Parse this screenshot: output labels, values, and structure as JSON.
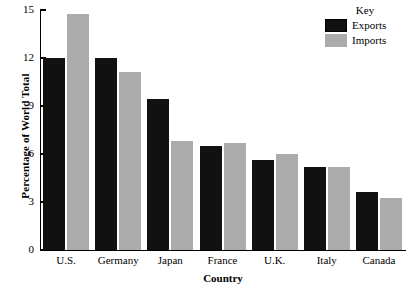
{
  "chart_data": {
    "type": "bar",
    "title": "",
    "xlabel": "Country",
    "ylabel": "Percentage of World Total",
    "categories": [
      "U.S.",
      "Germany",
      "Japan",
      "France",
      "U.K.",
      "Italy",
      "Canada"
    ],
    "series": [
      {
        "name": "Exports",
        "color": "#111111",
        "values": [
          12.0,
          12.0,
          9.45,
          6.5,
          5.6,
          5.2,
          3.6
        ]
      },
      {
        "name": "Imports",
        "color": "#ababab",
        "values": [
          14.75,
          11.1,
          6.8,
          6.7,
          6.0,
          5.2,
          3.25
        ]
      }
    ],
    "ylim": [
      0,
      15
    ],
    "yticks": [
      0,
      3,
      6,
      9,
      12,
      15
    ],
    "ytick_labels": [
      "0",
      "3",
      "6",
      "9",
      "12",
      "15"
    ],
    "grid": false,
    "legend": {
      "title": "Key",
      "position": "top-right",
      "entries": [
        {
          "label": "Exports",
          "color": "#111111"
        },
        {
          "label": "Imports",
          "color": "#ababab"
        }
      ]
    }
  }
}
